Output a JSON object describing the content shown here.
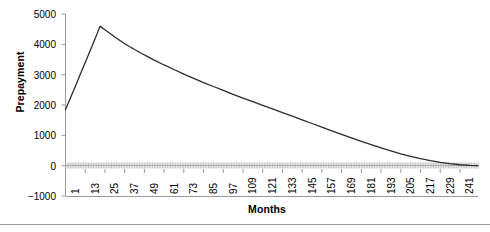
{
  "chart_data": {
    "type": "line",
    "title": "",
    "subtitle": "",
    "xlabel": "Months",
    "ylabel": "Prepayment",
    "grid": false,
    "legend": null,
    "xlim": [
      1,
      252
    ],
    "ylim": [
      -1000,
      5000
    ],
    "ytick_labels": [
      "5000",
      "4000",
      "3000",
      "2000",
      "1000",
      "0",
      "-1000"
    ],
    "ytick_values": [
      5000,
      4000,
      3000,
      2000,
      1000,
      0,
      -1000
    ],
    "xtick_labels": [
      "1",
      "13",
      "25",
      "37",
      "49",
      "61",
      "73",
      "85",
      "97",
      "109",
      "121",
      "133",
      "145",
      "157",
      "169",
      "181",
      "193",
      "205",
      "217",
      "229",
      "241"
    ],
    "xtick_values": [
      1,
      13,
      25,
      37,
      49,
      61,
      73,
      85,
      97,
      109,
      121,
      133,
      145,
      157,
      169,
      181,
      193,
      205,
      217,
      229,
      241
    ],
    "series": [
      {
        "name": "Prepayment",
        "color": "#2b2b2b",
        "x": [
          1,
          4,
          7,
          10,
          13,
          16,
          19,
          22,
          25,
          31,
          37,
          43,
          49,
          55,
          61,
          67,
          73,
          79,
          85,
          91,
          97,
          103,
          109,
          115,
          121,
          127,
          133,
          139,
          145,
          151,
          157,
          163,
          169,
          175,
          181,
          187,
          193,
          199,
          205,
          211,
          217,
          223,
          229,
          235,
          241,
          247,
          252
        ],
        "values": [
          1850,
          2230,
          2620,
          3010,
          3400,
          3790,
          4180,
          4600,
          4480,
          4240,
          4020,
          3830,
          3650,
          3480,
          3320,
          3170,
          3020,
          2880,
          2740,
          2610,
          2480,
          2350,
          2230,
          2110,
          1990,
          1870,
          1750,
          1630,
          1510,
          1390,
          1270,
          1150,
          1030,
          915,
          800,
          690,
          585,
          485,
          390,
          305,
          230,
          165,
          110,
          65,
          30,
          8,
          0
        ]
      }
    ],
    "annotations": [],
    "notes": {
      "peak_value": 4600,
      "peak_month": 22,
      "start_value": 1850,
      "end_value": 0
    }
  },
  "axis": {
    "ylabel": "Prepayment",
    "xlabel": "Months"
  }
}
